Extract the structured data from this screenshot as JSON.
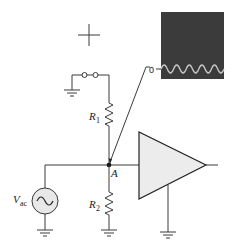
{
  "diagram": {
    "type": "circuit-schematic",
    "components": {
      "r1": {
        "label": "R",
        "subscript": "1"
      },
      "r2": {
        "label": "R",
        "subscript": "2"
      },
      "source": {
        "label": "V",
        "subscript": "ac"
      },
      "node": {
        "label": "A"
      },
      "scope": {
        "zero_label": "0"
      }
    },
    "colors": {
      "wire": "#3a3a3a",
      "scope_screen": "#3b3b3b",
      "waveform": "#c8c8c8",
      "amplifier_fill": "#ececec",
      "source_fill": "#e8e8e8"
    }
  }
}
